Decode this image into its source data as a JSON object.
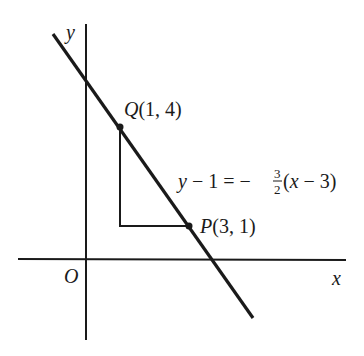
{
  "diagram": {
    "type": "coordinate-plane",
    "axes": {
      "x_label": "x",
      "y_label": "y",
      "origin_label": "O"
    },
    "points": [
      {
        "name": "Q",
        "label": "Q(1, 4)",
        "coords": [
          1,
          4
        ]
      },
      {
        "name": "P",
        "label": "P(3, 1)",
        "coords": [
          3,
          1
        ]
      }
    ],
    "line": {
      "equation_lhs": "y − 1 = −",
      "slope_num": "3",
      "slope_den": "2",
      "equation_rhs": "(x − 3)",
      "slope": -1.5
    },
    "slope_triangle": {
      "rise": -3,
      "run": 2
    },
    "colors": {
      "ink": "#1a1a1a",
      "background": "#ffffff"
    }
  }
}
